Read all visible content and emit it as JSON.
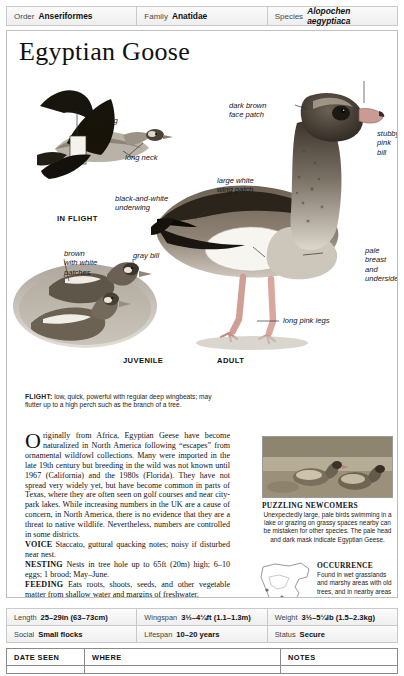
{
  "taxonomy": [
    {
      "key": "Order",
      "value": "Anseriformes",
      "italic": false
    },
    {
      "key": "Family",
      "value": "Anatidae",
      "italic": false
    },
    {
      "key": "Species",
      "value": "Alopochen aegyptiaca",
      "italic": true
    }
  ],
  "title": "Egyptian Goose",
  "art_labels": {
    "white_forewing": "white\nforewing",
    "long_neck": "long neck",
    "black_and_white_underwing": "black-and-white\nunderwing",
    "in_flight": "IN FLIGHT",
    "brown_with_white_patches": "brown\nwith white\npatches",
    "gray_bill": "gray bill",
    "juvenile": "JUVENILE",
    "adult": "ADULT",
    "dark_brown_face_patch": "dark brown\nface patch",
    "stubby_pink_bill": "stubby\npink\nbill",
    "large_white_wing_patch": "large white\nwing patch",
    "pale_breast_and_underside": "pale\nbreast\nand\nunderside",
    "long_pink_legs": "long pink legs"
  },
  "flight_note": {
    "label": "FLIGHT:",
    "text": " low, quick, powerful with regular deep wingbeats; may flutter up to a high perch such as the branch of a tree."
  },
  "body": {
    "dropcap": "O",
    "paragraph": "riginally from Africa, Egyptian Geese have become naturalized in North America following “escapes” from ornamental wildfowl collections. Many were imported in the late 19th century but breeding in the wild was not known until 1967 (California) and the 1980s (Florida). They have not spread very widely yet, but have become common in parts of Texas, where they are often seen on golf courses and near city-park lakes. While increasing numbers in the UK are a cause of concern, in North America, there is no evidence that they are a threat to native wildlife. Nevertheless, numbers are controlled in some districts.",
    "voice_label": "VOICE",
    "voice_text": " Staccato, guttural quacking notes; noisy if disturbed near nest.",
    "nesting_label": "NESTING",
    "nesting_text": " Nests in tree hole up to 65ft (20m) high; 6–10 eggs; 1 brood; May–June.",
    "feeding_label": "FEEDING",
    "feeding_text": " Eats roots, shoots, seeds, and other vegetable matter from shallow water and margins of freshwater."
  },
  "puzzling": {
    "heading": "PUZZLING NEWCOMERS",
    "text": "Unexpectedly large, pale birds swimming in a lake or grazing on grassy spaces nearby can be mistaken for other species. The pale head and dark mask indicate Egyptian Geese."
  },
  "occurrence": {
    "heading": "OCCURRENCE",
    "text": "Found in wet grasslands and marshy areas with old trees, and in nearby areas of short grass; most common in southern Florida, southeastern Texas, and around Los Angeles, California."
  },
  "stats": [
    [
      {
        "key": "Length",
        "value": "25–29in (63–73cm)"
      },
      {
        "key": "Wingspan",
        "value": "3½–4¼ft (1.1–1.3m)"
      },
      {
        "key": "Weight",
        "value": "3½–5¼lb (1.5–2.3kg)"
      }
    ],
    [
      {
        "key": "Social",
        "value": "Small flocks"
      },
      {
        "key": "Lifespan",
        "value": "10–20 years"
      },
      {
        "key": "Status",
        "value": "Secure"
      }
    ]
  ],
  "notes_table": {
    "columns": [
      "DATE SEEN",
      "WHERE",
      "NOTES"
    ]
  },
  "colors": {
    "frame": "#bfbfbf",
    "table_header_bg": "#f4f4f4",
    "text": "#111111"
  }
}
